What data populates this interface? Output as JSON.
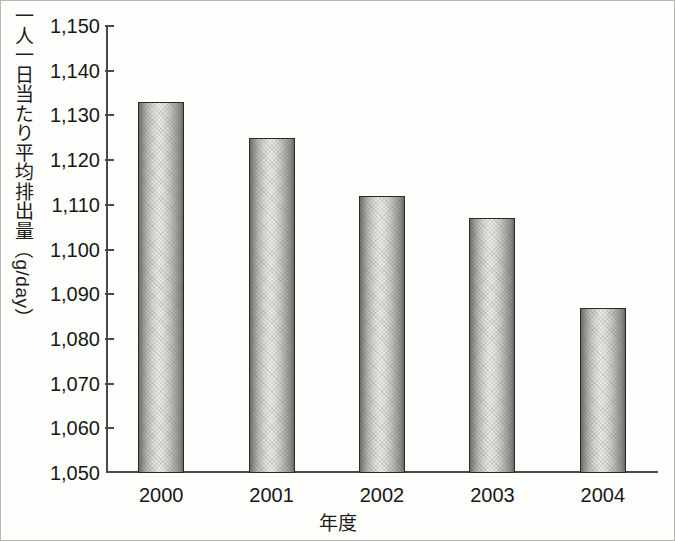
{
  "chart_data": {
    "type": "bar",
    "title": "",
    "subtitle": "",
    "xlabel": "年度",
    "ylabel": "一人一日当たり平均排出量（g/day）",
    "categories": [
      "2000",
      "2001",
      "2002",
      "2003",
      "2004"
    ],
    "values": [
      1133,
      1125,
      1112,
      1107,
      1087
    ],
    "ylim": [
      1050,
      1150
    ],
    "ytick_labels": [
      "1,150",
      "1,140",
      "1,130",
      "1,120",
      "1,110",
      "1,100",
      "1,090",
      "1,080",
      "1,070",
      "1,060",
      "1,050"
    ],
    "ytick_values": [
      1150,
      1140,
      1130,
      1120,
      1110,
      1100,
      1090,
      1080,
      1070,
      1060,
      1050
    ],
    "grid": false,
    "legend": null,
    "legend_position": "none",
    "series": [
      {
        "name": "一人一日当たり平均排出量",
        "values": [
          1133,
          1125,
          1112,
          1107,
          1087
        ]
      }
    ],
    "annotations": []
  },
  "axis": {
    "y_title_vertical_cjk": "一人一日当たり平均排出量",
    "y_title_unit": "（g/day）",
    "x_title": "年度"
  },
  "colors": {
    "axis": "#4c4a47",
    "text": "#171717",
    "bar_outline": "#2b2a28",
    "bar_light": "#eceae5",
    "bar_dark": "#6f6d69",
    "background": "#fefefc",
    "frame": "#b9b7b1"
  }
}
